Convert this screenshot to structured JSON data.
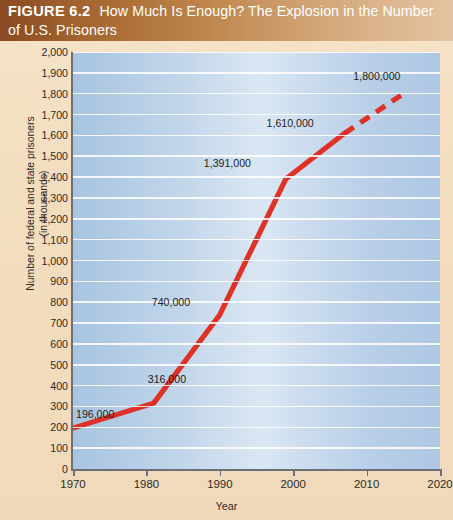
{
  "figure": {
    "number_label": "FIGURE 6.2",
    "title_line1": "How Much Is Enough? The Explosion in the Number",
    "title_line2": "of U.S. Prisoners",
    "header_gradient_start": "#8a4a22",
    "header_gradient_end": "#e3c3a2",
    "page_background": "#f3ddbf"
  },
  "chart_data": {
    "type": "line",
    "title": "How Much Is Enough? The Explosion in the Number of U.S. Prisoners",
    "xlabel": "Year",
    "ylabel": "Number of federal and state prisoners (in thousands)",
    "ylabel_line1": "Number of federal and state prisoners",
    "ylabel_line2": "(in thousands)",
    "xlim": [
      1970,
      2020
    ],
    "ylim": [
      0,
      2000
    ],
    "xticks": [
      1970,
      1980,
      1990,
      2000,
      2010,
      2020
    ],
    "xtick_labels": [
      "1970",
      "1980",
      "1990",
      "2000",
      "2010",
      "2020"
    ],
    "yticks": [
      0,
      100,
      200,
      300,
      400,
      500,
      600,
      700,
      800,
      900,
      1000,
      1100,
      1200,
      1300,
      1400,
      1500,
      1600,
      1700,
      1800,
      1900,
      2000
    ],
    "ytick_labels": [
      "0",
      "100",
      "200",
      "300",
      "400",
      "500",
      "600",
      "700",
      "800",
      "900",
      "1,000",
      "1,100",
      "1,200",
      "1,300",
      "1,400",
      "1,500",
      "1,600",
      "1,700",
      "1,800",
      "1,900",
      "2,000"
    ],
    "grid": true,
    "legend": false,
    "line_color": "#e03127",
    "plot_bg_center": "#dae7f3",
    "plot_bg_edge": "#a8c4e0",
    "series": [
      {
        "name": "Federal and state prisoners (actual)",
        "style": "solid",
        "x": [
          1970,
          1981,
          1990,
          1999,
          2007
        ],
        "values": [
          196,
          316,
          740,
          1391,
          1610
        ]
      },
      {
        "name": "Projected",
        "style": "dashed",
        "x": [
          2007,
          2015
        ],
        "values": [
          1610,
          1800
        ]
      }
    ],
    "annotations": [
      {
        "text": "196,000",
        "x": 1970,
        "y": 196
      },
      {
        "text": "316,000",
        "x": 1981,
        "y": 316
      },
      {
        "text": "740,000",
        "x": 1990,
        "y": 740
      },
      {
        "text": "1,391,000",
        "x": 1999,
        "y": 1391
      },
      {
        "text": "1,610,000",
        "x": 2007,
        "y": 1610
      },
      {
        "text": "1,800,000",
        "x": 2015,
        "y": 1800
      }
    ]
  }
}
